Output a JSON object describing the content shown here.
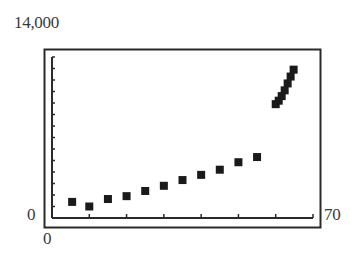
{
  "chart_data": {
    "type": "scatter",
    "title": "",
    "xlabel": "",
    "ylabel": "",
    "xlim": [
      0,
      70
    ],
    "ylim": [
      0,
      14000
    ],
    "tick_labels": {
      "y_max": "14,000",
      "y_min": "0",
      "x_min": "0",
      "x_max": "70"
    },
    "grid": false,
    "legend": null,
    "x_tick_interval": 10,
    "y_tick_interval": 1000,
    "series": [
      {
        "name": "data",
        "marker": "square",
        "points": [
          {
            "x": 5.4,
            "y": 1400
          },
          {
            "x": 10,
            "y": 1000
          },
          {
            "x": 15,
            "y": 1650
          },
          {
            "x": 20,
            "y": 1900
          },
          {
            "x": 25,
            "y": 2350
          },
          {
            "x": 30,
            "y": 2800
          },
          {
            "x": 35,
            "y": 3300
          },
          {
            "x": 40,
            "y": 3750
          },
          {
            "x": 45,
            "y": 4200
          },
          {
            "x": 50,
            "y": 4850
          },
          {
            "x": 55,
            "y": 5300
          },
          {
            "x": 60,
            "y": 9900
          },
          {
            "x": 60.8,
            "y": 10200
          },
          {
            "x": 61.6,
            "y": 10600
          },
          {
            "x": 62.4,
            "y": 11100
          },
          {
            "x": 63.2,
            "y": 11700
          },
          {
            "x": 64,
            "y": 12300
          },
          {
            "x": 64.8,
            "y": 12900
          }
        ]
      }
    ]
  }
}
